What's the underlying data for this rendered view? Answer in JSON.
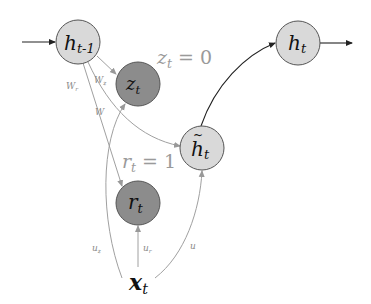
{
  "diagram": {
    "colors": {
      "light_node_fill": "#d9d9d9",
      "dark_node_fill": "#8c8c8c",
      "node_stroke": "#555555",
      "main_edge": "#222222",
      "gate_edge": "#a0a0a0",
      "edge_label": "#8a8a8a",
      "annotation": "#9a9a9a"
    },
    "nodes": {
      "h_prev": {
        "base": "h",
        "sub": "t-1",
        "type": "light"
      },
      "z": {
        "base": "z",
        "sub": "t",
        "type": "dark"
      },
      "h_tilde": {
        "base": "h",
        "sub": "t",
        "tilde": "~",
        "type": "light"
      },
      "h": {
        "base": "h",
        "sub": "t",
        "type": "light"
      },
      "r": {
        "base": "r",
        "sub": "t",
        "type": "dark"
      },
      "x": {
        "base": "x",
        "sub": "t",
        "type": "input"
      }
    },
    "edge_labels": {
      "W_r": {
        "base": "W",
        "sub": "r"
      },
      "W_z": {
        "base": "W",
        "sub": "z"
      },
      "W": {
        "base": "W"
      },
      "U_z": {
        "base": "u",
        "sub": "z"
      },
      "U_r": {
        "base": "u",
        "sub": "r"
      },
      "U": {
        "base": "u"
      }
    },
    "annotations": {
      "z_value": {
        "var": "z",
        "sub": "t",
        "eq": " = 0"
      },
      "r_value": {
        "var": "r",
        "sub": "t",
        "eq": " = 1"
      }
    }
  }
}
